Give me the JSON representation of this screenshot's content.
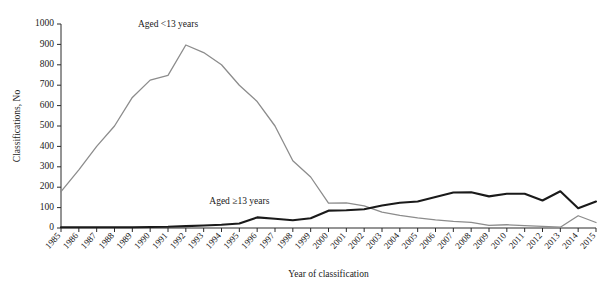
{
  "chart_data": {
    "type": "line",
    "title": "",
    "xlabel": "Year of classification",
    "ylabel": "Classifications, No",
    "ylim": [
      0,
      1000
    ],
    "ytick_step": 100,
    "grid": false,
    "legend_position": "inline-annotation",
    "x": [
      1985,
      1986,
      1987,
      1988,
      1989,
      1990,
      1991,
      1992,
      1993,
      1994,
      1995,
      1996,
      1997,
      1998,
      1999,
      2000,
      2001,
      2002,
      2003,
      2004,
      2005,
      2006,
      2007,
      2008,
      2009,
      2010,
      2011,
      2012,
      2013,
      2014,
      2015
    ],
    "xticklabels": [
      "1985",
      "1986",
      "1987",
      "1988",
      "1989",
      "1990",
      "1991",
      "1992",
      "1993",
      "1994",
      "1995",
      "1996",
      "1997",
      "1998",
      "1999",
      "2000",
      "2001",
      "2002",
      "2003",
      "2004",
      "2005",
      "2006",
      "2007",
      "2008",
      "2009",
      "2010",
      "2011",
      "2012",
      "2013",
      "2014",
      "2015"
    ],
    "yticklabels": [
      "0",
      "100",
      "200",
      "300",
      "400",
      "500",
      "600",
      "700",
      "800",
      "900",
      "1000"
    ],
    "series": [
      {
        "name": "Aged <13 years",
        "color": "#8c8c8c",
        "stroke_width": 1.3,
        "label_x_year": 1991,
        "label_y_value": 985,
        "values": [
          178,
          285,
          400,
          500,
          640,
          725,
          748,
          897,
          860,
          800,
          700,
          620,
          500,
          330,
          250,
          122,
          123,
          108,
          78,
          62,
          50,
          40,
          32,
          28,
          13,
          16,
          12,
          8,
          4,
          60,
          27
        ]
      },
      {
        "name": "Aged ≥13 years",
        "color": "#1a1a1a",
        "stroke_width": 2.1,
        "label_x_year": 1995,
        "label_y_value": 120,
        "values": [
          4,
          4,
          4,
          4,
          4,
          5,
          6,
          9,
          12,
          16,
          22,
          52,
          45,
          38,
          48,
          85,
          87,
          92,
          110,
          124,
          130,
          152,
          174,
          175,
          155,
          168,
          168,
          135,
          180,
          97,
          130
        ]
      }
    ],
    "annotations": [
      {
        "text": "Aged <13 years",
        "series": 0
      },
      {
        "text": "Aged ≥13 years",
        "series": 1
      }
    ]
  }
}
